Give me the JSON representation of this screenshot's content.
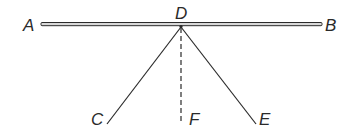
{
  "diagram": {
    "type": "geometry",
    "colors": {
      "ink": "#2a2a2a",
      "background": "#ffffff"
    },
    "points": {
      "A": {
        "label": "A",
        "x": 41,
        "y": 24
      },
      "B": {
        "label": "B",
        "x": 322,
        "y": 24
      },
      "D": {
        "label": "D",
        "x": 181,
        "y": 26
      },
      "C": {
        "label": "C",
        "x": 107,
        "y": 124
      },
      "F": {
        "label": "F",
        "x": 181,
        "y": 124
      },
      "E": {
        "label": "E",
        "x": 256,
        "y": 124
      }
    },
    "segments": [
      {
        "from": "A",
        "to": "B",
        "style": "double-bar"
      },
      {
        "from": "D",
        "to": "C",
        "style": "solid"
      },
      {
        "from": "D",
        "to": "E",
        "style": "solid"
      },
      {
        "from": "D",
        "to": "F",
        "style": "dashed"
      }
    ]
  }
}
